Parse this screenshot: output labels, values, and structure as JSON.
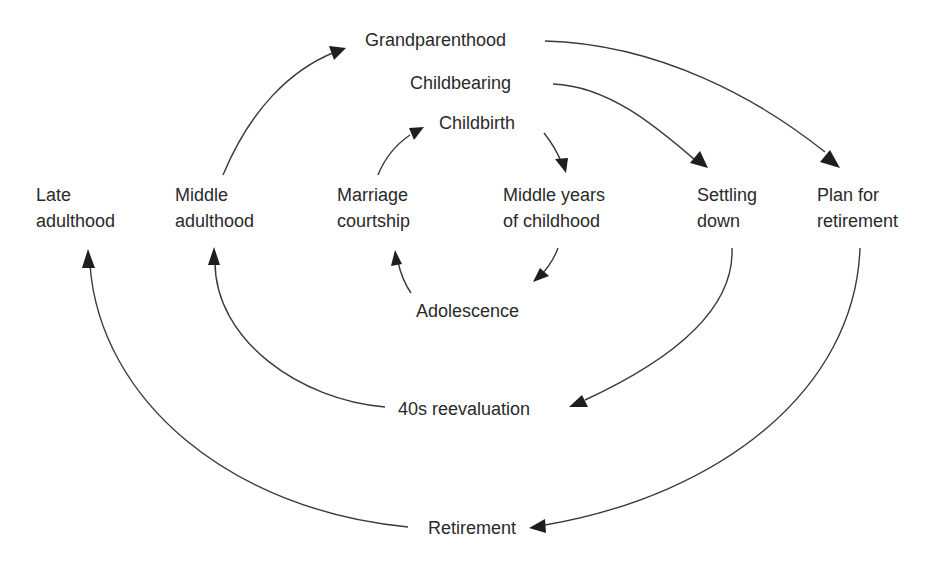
{
  "diagram": {
    "nodes": {
      "grandparenthood": {
        "lines": [
          "Grandparenthood"
        ]
      },
      "childbearing": {
        "lines": [
          "Childbearing"
        ]
      },
      "childbirth": {
        "lines": [
          "Childbirth"
        ]
      },
      "late_adulthood": {
        "lines": [
          "Late",
          "adulthood"
        ]
      },
      "middle_adulthood": {
        "lines": [
          "Middle",
          "adulthood"
        ]
      },
      "marriage_courtship": {
        "lines": [
          "Marriage",
          "courtship"
        ]
      },
      "middle_years_childhood": {
        "lines": [
          "Middle years",
          "of childhood"
        ]
      },
      "settling_down": {
        "lines": [
          "Settling",
          "down"
        ]
      },
      "plan_for_retirement": {
        "lines": [
          "Plan for",
          "retirement"
        ]
      },
      "adolescence": {
        "lines": [
          "Adolescence"
        ]
      },
      "forties_reevaluation": {
        "lines": [
          "40s reevaluation"
        ]
      },
      "retirement": {
        "lines": [
          "Retirement"
        ]
      }
    },
    "edges": [
      {
        "from": "Childbirth",
        "to": "Middle years of childhood"
      },
      {
        "from": "Middle years of childhood",
        "to": "Adolescence"
      },
      {
        "from": "Adolescence",
        "to": "Marriage courtship"
      },
      {
        "from": "Marriage courtship",
        "to": "Childbirth"
      },
      {
        "from": "Childbearing",
        "to": "Settling down"
      },
      {
        "from": "Settling down",
        "to": "40s reevaluation"
      },
      {
        "from": "40s reevaluation",
        "to": "Middle adulthood"
      },
      {
        "from": "Middle adulthood",
        "to": "Grandparenthood"
      },
      {
        "from": "Grandparenthood",
        "to": "Plan for retirement"
      },
      {
        "from": "Plan for retirement",
        "to": "Retirement"
      },
      {
        "from": "Retirement",
        "to": "Late adulthood"
      }
    ]
  }
}
